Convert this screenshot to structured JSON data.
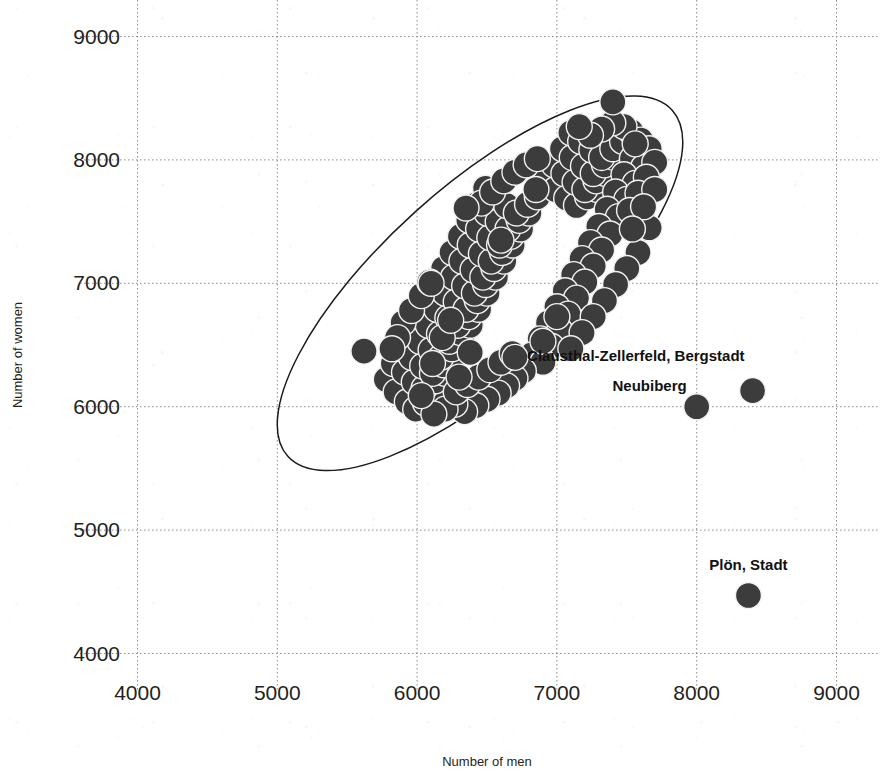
{
  "chart_data": {
    "type": "scatter",
    "title": "",
    "xlabel": "Number of men",
    "ylabel": "Number of women",
    "xlim": [
      3500,
      9300
    ],
    "ylim": [
      3800,
      9300
    ],
    "xticks": [
      4000,
      5000,
      6000,
      7000,
      8000,
      9000
    ],
    "yticks": [
      4000,
      5000,
      6000,
      7000,
      8000,
      9000
    ],
    "xtick_labels": [
      "4000",
      "5000",
      "6000",
      "7000",
      "8000",
      "9000"
    ],
    "ytick_labels": [
      "4000",
      "5000",
      "6000",
      "7000",
      "8000",
      "9000"
    ],
    "grid": true,
    "grid_style": "dotted",
    "legend": "none",
    "marker_color": "#3c3c3c",
    "marker_edge_color": "#f2f2f2",
    "marker_size_px": 26,
    "confidence_ellipse": {
      "present": true,
      "center": [
        6450,
        7000
      ],
      "semi_major": 1850,
      "semi_minor": 690,
      "angle_deg": -42,
      "stroke": "#1b1b1b"
    },
    "annotations": [
      {
        "label": "Clausthal-Zellerfeld, Bergstadt",
        "x": 8400,
        "y": 6130,
        "label_anchor": "end",
        "label_dx": -8,
        "label_dy": -30
      },
      {
        "label": "Neubiberg",
        "x": 8000,
        "y": 6000,
        "label_anchor": "end",
        "label_dx": -10,
        "label_dy": -16
      },
      {
        "label": "Plön, Stadt",
        "x": 8370,
        "y": 4470,
        "label_anchor": "middle",
        "label_dx": 0,
        "label_dy": -26
      }
    ],
    "outlier_points": [
      {
        "x": 7400,
        "y": 8470
      },
      {
        "x": 6350,
        "y": 7610
      },
      {
        "x": 6850,
        "y": 7760
      },
      {
        "x": 6600,
        "y": 7350
      },
      {
        "x": 6100,
        "y": 7000
      },
      {
        "x": 5620,
        "y": 6450
      },
      {
        "x": 7000,
        "y": 6730
      },
      {
        "x": 6900,
        "y": 6530
      },
      {
        "x": 6700,
        "y": 6400
      },
      {
        "x": 8000,
        "y": 6000
      },
      {
        "x": 8400,
        "y": 6130
      },
      {
        "x": 8370,
        "y": 4470
      }
    ],
    "cluster_points": [
      {
        "x": 5780,
        "y": 6220
      },
      {
        "x": 5850,
        "y": 6120
      },
      {
        "x": 5930,
        "y": 6040
      },
      {
        "x": 5990,
        "y": 5980
      },
      {
        "x": 6060,
        "y": 6030
      },
      {
        "x": 6140,
        "y": 6090
      },
      {
        "x": 5830,
        "y": 6350
      },
      {
        "x": 5910,
        "y": 6280
      },
      {
        "x": 5980,
        "y": 6200
      },
      {
        "x": 6050,
        "y": 6150
      },
      {
        "x": 6130,
        "y": 6210
      },
      {
        "x": 6200,
        "y": 6270
      },
      {
        "x": 5890,
        "y": 6470
      },
      {
        "x": 5960,
        "y": 6400
      },
      {
        "x": 6040,
        "y": 6330
      },
      {
        "x": 6110,
        "y": 6270
      },
      {
        "x": 6190,
        "y": 6340
      },
      {
        "x": 6260,
        "y": 6400
      },
      {
        "x": 5950,
        "y": 6600
      },
      {
        "x": 6020,
        "y": 6530
      },
      {
        "x": 6100,
        "y": 6460
      },
      {
        "x": 6170,
        "y": 6400
      },
      {
        "x": 6250,
        "y": 6470
      },
      {
        "x": 6320,
        "y": 6540
      },
      {
        "x": 6010,
        "y": 6730
      },
      {
        "x": 6080,
        "y": 6660
      },
      {
        "x": 6160,
        "y": 6590
      },
      {
        "x": 6230,
        "y": 6530
      },
      {
        "x": 6310,
        "y": 6600
      },
      {
        "x": 6380,
        "y": 6660
      },
      {
        "x": 6070,
        "y": 6860
      },
      {
        "x": 6140,
        "y": 6790
      },
      {
        "x": 6220,
        "y": 6720
      },
      {
        "x": 6290,
        "y": 6660
      },
      {
        "x": 6370,
        "y": 6730
      },
      {
        "x": 6440,
        "y": 6790
      },
      {
        "x": 6130,
        "y": 6990
      },
      {
        "x": 6200,
        "y": 6920
      },
      {
        "x": 6280,
        "y": 6850
      },
      {
        "x": 6350,
        "y": 6790
      },
      {
        "x": 6430,
        "y": 6860
      },
      {
        "x": 6500,
        "y": 6920
      },
      {
        "x": 6190,
        "y": 7120
      },
      {
        "x": 6260,
        "y": 7050
      },
      {
        "x": 6340,
        "y": 6980
      },
      {
        "x": 6410,
        "y": 6920
      },
      {
        "x": 6490,
        "y": 6990
      },
      {
        "x": 6560,
        "y": 7050
      },
      {
        "x": 6250,
        "y": 7250
      },
      {
        "x": 6320,
        "y": 7180
      },
      {
        "x": 6400,
        "y": 7110
      },
      {
        "x": 6470,
        "y": 7050
      },
      {
        "x": 6550,
        "y": 7120
      },
      {
        "x": 6620,
        "y": 7180
      },
      {
        "x": 6310,
        "y": 7380
      },
      {
        "x": 6380,
        "y": 7310
      },
      {
        "x": 6460,
        "y": 7240
      },
      {
        "x": 6530,
        "y": 7180
      },
      {
        "x": 6610,
        "y": 7250
      },
      {
        "x": 6680,
        "y": 7310
      },
      {
        "x": 6370,
        "y": 7510
      },
      {
        "x": 6440,
        "y": 7440
      },
      {
        "x": 6520,
        "y": 7370
      },
      {
        "x": 6590,
        "y": 7310
      },
      {
        "x": 6670,
        "y": 7380
      },
      {
        "x": 6740,
        "y": 7440
      },
      {
        "x": 6430,
        "y": 7640
      },
      {
        "x": 6500,
        "y": 7570
      },
      {
        "x": 6580,
        "y": 7500
      },
      {
        "x": 6650,
        "y": 7440
      },
      {
        "x": 6730,
        "y": 7510
      },
      {
        "x": 6800,
        "y": 7570
      },
      {
        "x": 6490,
        "y": 7770
      },
      {
        "x": 6560,
        "y": 7700
      },
      {
        "x": 6640,
        "y": 7630
      },
      {
        "x": 6710,
        "y": 7570
      },
      {
        "x": 6790,
        "y": 7640
      },
      {
        "x": 6860,
        "y": 7700
      },
      {
        "x": 6920,
        "y": 7830
      },
      {
        "x": 6990,
        "y": 7760
      },
      {
        "x": 7070,
        "y": 7690
      },
      {
        "x": 7140,
        "y": 7630
      },
      {
        "x": 7220,
        "y": 7700
      },
      {
        "x": 7290,
        "y": 7760
      },
      {
        "x": 6980,
        "y": 7960
      },
      {
        "x": 7050,
        "y": 7890
      },
      {
        "x": 7130,
        "y": 7820
      },
      {
        "x": 7200,
        "y": 7760
      },
      {
        "x": 7280,
        "y": 7830
      },
      {
        "x": 7350,
        "y": 7890
      },
      {
        "x": 7040,
        "y": 8090
      },
      {
        "x": 7110,
        "y": 8020
      },
      {
        "x": 7190,
        "y": 7950
      },
      {
        "x": 7260,
        "y": 7890
      },
      {
        "x": 7340,
        "y": 7960
      },
      {
        "x": 7410,
        "y": 8020
      },
      {
        "x": 7100,
        "y": 8220
      },
      {
        "x": 7170,
        "y": 8150
      },
      {
        "x": 7250,
        "y": 8080
      },
      {
        "x": 7320,
        "y": 8020
      },
      {
        "x": 7400,
        "y": 8090
      },
      {
        "x": 7470,
        "y": 8150
      },
      {
        "x": 7530,
        "y": 8230
      },
      {
        "x": 7600,
        "y": 8160
      },
      {
        "x": 7660,
        "y": 8090
      },
      {
        "x": 7540,
        "y": 8010
      },
      {
        "x": 7620,
        "y": 7940
      },
      {
        "x": 7700,
        "y": 7980
      },
      {
        "x": 7480,
        "y": 7880
      },
      {
        "x": 7560,
        "y": 7810
      },
      {
        "x": 7640,
        "y": 7860
      },
      {
        "x": 7420,
        "y": 7740
      },
      {
        "x": 7500,
        "y": 7680
      },
      {
        "x": 7580,
        "y": 7730
      },
      {
        "x": 7360,
        "y": 7600
      },
      {
        "x": 7440,
        "y": 7540
      },
      {
        "x": 7520,
        "y": 7590
      },
      {
        "x": 7300,
        "y": 7460
      },
      {
        "x": 7380,
        "y": 7400
      },
      {
        "x": 7660,
        "y": 7450
      },
      {
        "x": 7240,
        "y": 7330
      },
      {
        "x": 7320,
        "y": 7270
      },
      {
        "x": 7580,
        "y": 7250
      },
      {
        "x": 7180,
        "y": 7200
      },
      {
        "x": 7260,
        "y": 7140
      },
      {
        "x": 7500,
        "y": 7120
      },
      {
        "x": 7120,
        "y": 7070
      },
      {
        "x": 7200,
        "y": 7010
      },
      {
        "x": 7420,
        "y": 6990
      },
      {
        "x": 7060,
        "y": 6940
      },
      {
        "x": 7140,
        "y": 6880
      },
      {
        "x": 7340,
        "y": 6860
      },
      {
        "x": 7000,
        "y": 6810
      },
      {
        "x": 7080,
        "y": 6750
      },
      {
        "x": 7260,
        "y": 6730
      },
      {
        "x": 6940,
        "y": 6680
      },
      {
        "x": 7020,
        "y": 6620
      },
      {
        "x": 7180,
        "y": 6600
      },
      {
        "x": 6880,
        "y": 6550
      },
      {
        "x": 6960,
        "y": 6490
      },
      {
        "x": 7100,
        "y": 6470
      },
      {
        "x": 6820,
        "y": 6420
      },
      {
        "x": 6900,
        "y": 6360
      },
      {
        "x": 6760,
        "y": 6290
      },
      {
        "x": 6700,
        "y": 6230
      },
      {
        "x": 6640,
        "y": 6170
      },
      {
        "x": 6580,
        "y": 6110
      },
      {
        "x": 6500,
        "y": 6060
      },
      {
        "x": 6420,
        "y": 6010
      },
      {
        "x": 6340,
        "y": 5960
      },
      {
        "x": 6270,
        "y": 6020
      },
      {
        "x": 6200,
        "y": 5980
      },
      {
        "x": 6120,
        "y": 5940
      },
      {
        "x": 5900,
        "y": 6680
      },
      {
        "x": 5960,
        "y": 6780
      },
      {
        "x": 6030,
        "y": 6900
      },
      {
        "x": 5860,
        "y": 6560
      },
      {
        "x": 5820,
        "y": 6470
      },
      {
        "x": 6090,
        "y": 7010
      },
      {
        "x": 6460,
        "y": 7650
      },
      {
        "x": 6540,
        "y": 7740
      },
      {
        "x": 6620,
        "y": 7830
      },
      {
        "x": 6700,
        "y": 7900
      },
      {
        "x": 6780,
        "y": 7960
      },
      {
        "x": 6860,
        "y": 8010
      },
      {
        "x": 7480,
        "y": 8270
      },
      {
        "x": 7400,
        "y": 8300
      },
      {
        "x": 7320,
        "y": 8250
      },
      {
        "x": 7240,
        "y": 8200
      },
      {
        "x": 7160,
        "y": 8270
      },
      {
        "x": 7560,
        "y": 8130
      },
      {
        "x": 7700,
        "y": 7760
      },
      {
        "x": 7620,
        "y": 7620
      },
      {
        "x": 7540,
        "y": 7440
      },
      {
        "x": 6280,
        "y": 6120
      },
      {
        "x": 6360,
        "y": 6180
      },
      {
        "x": 6440,
        "y": 6240
      },
      {
        "x": 6520,
        "y": 6300
      },
      {
        "x": 6600,
        "y": 6360
      },
      {
        "x": 6680,
        "y": 6430
      },
      {
        "x": 6030,
        "y": 6090
      },
      {
        "x": 6110,
        "y": 6350
      },
      {
        "x": 6180,
        "y": 6560
      },
      {
        "x": 6240,
        "y": 6700
      },
      {
        "x": 6300,
        "y": 6240
      },
      {
        "x": 6380,
        "y": 6440
      }
    ]
  },
  "axes": {
    "y_title": "Number of women",
    "x_title": "Number of men"
  }
}
